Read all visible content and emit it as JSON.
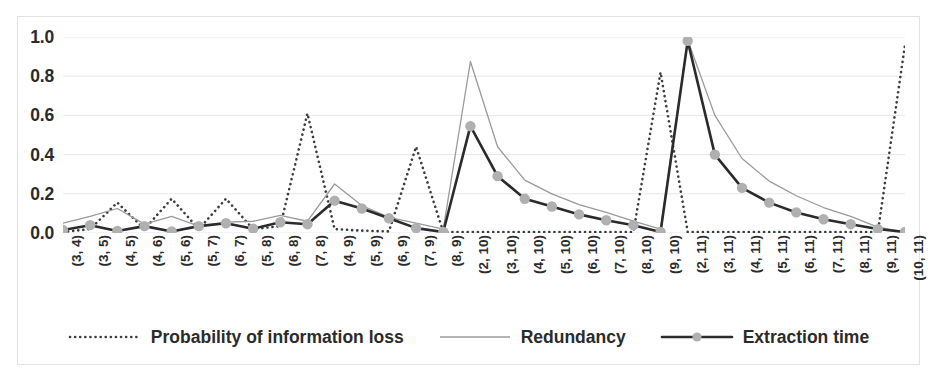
{
  "chart_data": {
    "type": "line",
    "title": "",
    "xlabel": "",
    "ylabel": "",
    "ylim": [
      0.0,
      1.0
    ],
    "ytick_values": [
      1.0,
      0.8,
      0.6,
      0.4,
      0.2,
      0.0
    ],
    "ytick_labels": [
      "1.0",
      "0.8",
      "0.6",
      "0.4",
      "0.2",
      "0.0"
    ],
    "grid": true,
    "legend_position": "bottom",
    "categories": [
      "(3, 4)",
      "(3, 5)",
      "(4, 5)",
      "(4, 6)",
      "(5, 6)",
      "(5, 7)",
      "(6, 7)",
      "(5, 8)",
      "(6, 8)",
      "(7, 8)",
      "(4, 9)",
      "(5, 9)",
      "(6, 9)",
      "(7, 9)",
      "(8, 9)",
      "(2, 10)",
      "(3, 10)",
      "(4, 10)",
      "(5, 10)",
      "(6, 10)",
      "(7, 10)",
      "(8, 10)",
      "(9, 10)",
      "(2, 11)",
      "(3, 11)",
      "(4, 11)",
      "(5, 11)",
      "(6, 11)",
      "(7, 11)",
      "(8, 11)",
      "(9, 11)",
      "(10, 11)"
    ],
    "series": [
      {
        "name": "Probability of information loss",
        "style": "dotted",
        "color": "#3d3d3d",
        "marker": "none",
        "values": [
          0.005,
          0.02,
          0.155,
          0.02,
          0.175,
          0.02,
          0.175,
          0.02,
          0.035,
          0.61,
          0.02,
          0.012,
          0.008,
          0.44,
          0.005,
          0.005,
          0.005,
          0.005,
          0.005,
          0.005,
          0.005,
          0.005,
          0.82,
          0.005,
          0.005,
          0.005,
          0.005,
          0.005,
          0.005,
          0.005,
          0.005,
          0.96
        ]
      },
      {
        "name": "Redundancy",
        "style": "solid-thin",
        "color": "#9a9a9a",
        "marker": "none",
        "values": [
          0.05,
          0.085,
          0.125,
          0.045,
          0.085,
          0.035,
          0.055,
          0.06,
          0.09,
          0.06,
          0.25,
          0.14,
          0.08,
          0.05,
          0.02,
          0.875,
          0.44,
          0.27,
          0.2,
          0.145,
          0.105,
          0.06,
          0.02,
          0.985,
          0.6,
          0.38,
          0.265,
          0.19,
          0.13,
          0.085,
          0.03,
          0.005
        ]
      },
      {
        "name": "Extraction time",
        "style": "solid-thick",
        "color": "#2b2b2b",
        "marker": "circle",
        "marker_color": "#b0b0b0",
        "values": [
          0.015,
          0.04,
          0.01,
          0.035,
          0.008,
          0.035,
          0.05,
          0.022,
          0.055,
          0.045,
          0.165,
          0.125,
          0.075,
          0.025,
          0.005,
          0.545,
          0.29,
          0.175,
          0.135,
          0.095,
          0.065,
          0.04,
          0.005,
          0.98,
          0.4,
          0.23,
          0.155,
          0.105,
          0.07,
          0.045,
          0.02,
          0.005
        ]
      }
    ]
  },
  "legend": {
    "items": [
      {
        "label": "Probability of information loss",
        "swatch": "dotted-line-swatch"
      },
      {
        "label": "Redundancy",
        "swatch": "thin-line-swatch"
      },
      {
        "label": "Extraction time",
        "swatch": "marker-line-swatch"
      }
    ]
  },
  "colors": {
    "probability_of_information_loss": "#3d3d3d",
    "redundancy": "#9a9a9a",
    "extraction_time": "#2b2b2b",
    "marker_fill": "#b0b0b0",
    "gridline": "#e4e7ea",
    "border": "#e2e2e2",
    "text": "#2b2b2b"
  }
}
